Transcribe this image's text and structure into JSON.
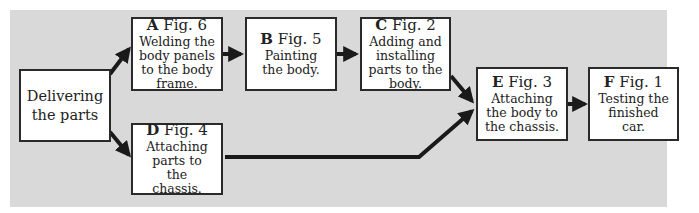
{
  "diagram": {
    "type": "flowchart",
    "background_color": "#d9d9d9",
    "arrow_color": "#1a1a1a",
    "start": {
      "text": "Delivering the parts"
    },
    "steps": [
      {
        "id": "A",
        "fig": "Fig. 6",
        "text": "Welding the body panels to the body frame."
      },
      {
        "id": "B",
        "fig": "Fig. 5",
        "text": "Painting the body."
      },
      {
        "id": "C",
        "fig": "Fig. 2",
        "text": "Adding and installing parts to the body."
      },
      {
        "id": "D",
        "fig": "Fig. 4",
        "text": "Attaching parts to the chassis."
      },
      {
        "id": "E",
        "fig": "Fig. 3",
        "text": "Attaching the body to the chassis."
      },
      {
        "id": "F",
        "fig": "Fig. 1",
        "text": "Testing the finished car."
      }
    ],
    "edges": [
      {
        "from": "start",
        "to": "A"
      },
      {
        "from": "start",
        "to": "D"
      },
      {
        "from": "A",
        "to": "B"
      },
      {
        "from": "B",
        "to": "C"
      },
      {
        "from": "C",
        "to": "E"
      },
      {
        "from": "D",
        "to": "E"
      },
      {
        "from": "E",
        "to": "F"
      }
    ]
  }
}
